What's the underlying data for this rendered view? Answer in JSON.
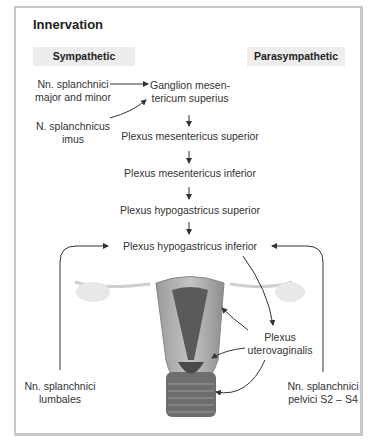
{
  "title": "Innervation",
  "headers": {
    "sympathetic": "Sympathetic",
    "parasympathetic": "Parasympathetic"
  },
  "nodes": {
    "splanchnici_major_minor": [
      "Nn. splanchnici",
      "major and minor"
    ],
    "splanchnicus_imus": [
      "N. splanchnicus",
      "imus"
    ],
    "ganglion": [
      "Ganglion mesen-",
      "tericum superius"
    ],
    "plexus_mes_sup": "Plexus mesentericus superior",
    "plexus_mes_inf": "Plexus mesentericus inferior",
    "plexus_hypo_sup": "Plexus hypogastricus superior",
    "plexus_hypo_inf": "Plexus hypogastricus inferior",
    "plexus_uterovaginalis": [
      "Plexus",
      "uterovaginalis"
    ],
    "splanchnici_lumbales": [
      "Nn. splanchnici",
      "lumbales"
    ],
    "splanchnici_pelvici": [
      "Nn. splanchnici",
      "pelvici S2 – S4"
    ]
  },
  "colors": {
    "frame": "#c8c8c8",
    "header_bg": "#ededed",
    "text": "#333333",
    "arrow": "#333333"
  }
}
